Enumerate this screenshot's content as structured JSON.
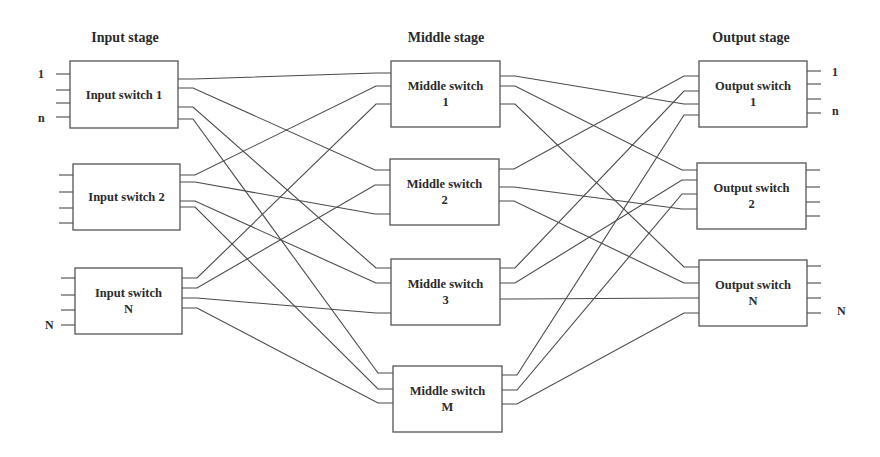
{
  "diagram": {
    "type": "three-stage Clos switching network",
    "stages": [
      {
        "id": "input",
        "title": "Input stage",
        "title_x": 125,
        "title_y": 42
      },
      {
        "id": "middle",
        "title": "Middle stage",
        "title_x": 446,
        "title_y": 42
      },
      {
        "id": "output",
        "title": "Output stage",
        "title_x": 751,
        "title_y": 42
      }
    ],
    "colors": {
      "line": "#4a4a4a",
      "box_border": "#555555",
      "text": "#2a2a2a",
      "background": "#ffffff"
    },
    "nodes": [
      {
        "id": "in1",
        "stage": "input",
        "label_lines": [
          "Input switch 1"
        ],
        "x": 70,
        "y": 61,
        "w": 108,
        "h": 67,
        "left_ports": [
          74,
          90,
          103,
          117
        ],
        "right_ports": [
          79,
          88,
          107,
          119
        ]
      },
      {
        "id": "in2",
        "stage": "input",
        "label_lines": [
          "Input switch 2"
        ],
        "x": 73,
        "y": 164,
        "w": 107,
        "h": 66,
        "left_ports": [
          175,
          192,
          208,
          223
        ],
        "right_ports": [
          175,
          182,
          201,
          207
        ]
      },
      {
        "id": "inN",
        "stage": "input",
        "label_lines": [
          "Input switch",
          "N"
        ],
        "x": 75,
        "y": 268,
        "w": 107,
        "h": 66,
        "left_ports": [
          278,
          295,
          310,
          325
        ],
        "right_ports": [
          278,
          288,
          298,
          308
        ]
      },
      {
        "id": "mid1",
        "stage": "middle",
        "label_lines": [
          "Middle switch",
          "1"
        ],
        "x": 391,
        "y": 61,
        "w": 109,
        "h": 66,
        "left_ports": [
          73,
          86,
          104
        ],
        "right_ports": [
          76,
          86,
          104
        ]
      },
      {
        "id": "mid2",
        "stage": "middle",
        "label_lines": [
          "Middle switch",
          "2"
        ],
        "x": 390,
        "y": 159,
        "w": 109,
        "h": 66,
        "left_ports": [
          170,
          185,
          214
        ],
        "right_ports": [
          169,
          187,
          201
        ]
      },
      {
        "id": "mid3",
        "stage": "middle",
        "label_lines": [
          "Middle switch",
          "3"
        ],
        "x": 391,
        "y": 259,
        "w": 109,
        "h": 66,
        "left_ports": [
          268,
          283,
          313
        ],
        "right_ports": [
          268,
          283,
          299
        ]
      },
      {
        "id": "midM",
        "stage": "middle",
        "label_lines": [
          "Middle switch",
          "M"
        ],
        "x": 393,
        "y": 366,
        "w": 109,
        "h": 66,
        "left_ports": [
          373,
          389,
          403
        ],
        "right_ports": [
          375,
          390,
          404
        ]
      },
      {
        "id": "out1",
        "stage": "output",
        "label_lines": [
          "Output switch",
          "1"
        ],
        "x": 699,
        "y": 61,
        "w": 108,
        "h": 66,
        "left_ports": [
          76,
          91,
          104,
          115
        ],
        "right_ports": [
          71,
          84,
          99,
          113
        ]
      },
      {
        "id": "out2",
        "stage": "output",
        "label_lines": [
          "Output switch",
          "2"
        ],
        "x": 697,
        "y": 163,
        "w": 109,
        "h": 66,
        "left_ports": [
          170,
          180,
          194,
          209
        ],
        "right_ports": [
          170,
          187,
          202,
          216
        ]
      },
      {
        "id": "outN",
        "stage": "output",
        "label_lines": [
          "Output switch",
          "N"
        ],
        "x": 699,
        "y": 260,
        "w": 108,
        "h": 66,
        "left_ports": [
          267,
          283,
          298,
          313
        ],
        "right_ports": [
          266,
          283,
          298,
          313
        ]
      }
    ],
    "port_labels": [
      {
        "text": "1",
        "x": 38,
        "y": 78
      },
      {
        "text": "n",
        "x": 38,
        "y": 122
      },
      {
        "text": "N",
        "x": 45,
        "y": 329
      },
      {
        "text": "1",
        "x": 832,
        "y": 76
      },
      {
        "text": "n",
        "x": 832,
        "y": 115
      },
      {
        "text": "N",
        "x": 837,
        "y": 315
      }
    ],
    "edges": [
      {
        "from": "in1",
        "fp": 0,
        "to": "mid1",
        "tp": 0
      },
      {
        "from": "in1",
        "fp": 1,
        "to": "mid2",
        "tp": 0
      },
      {
        "from": "in1",
        "fp": 2,
        "to": "mid3",
        "tp": 0
      },
      {
        "from": "in1",
        "fp": 3,
        "to": "midM",
        "tp": 0
      },
      {
        "from": "in2",
        "fp": 0,
        "to": "mid1",
        "tp": 1
      },
      {
        "from": "in2",
        "fp": 1,
        "to": "mid2",
        "tp": 2
      },
      {
        "from": "in2",
        "fp": 2,
        "to": "mid3",
        "tp": 1
      },
      {
        "from": "in2",
        "fp": 3,
        "to": "midM",
        "tp": 1
      },
      {
        "from": "inN",
        "fp": 0,
        "to": "mid1",
        "tp": 2
      },
      {
        "from": "inN",
        "fp": 1,
        "to": "mid2",
        "tp": 1
      },
      {
        "from": "inN",
        "fp": 2,
        "to": "mid3",
        "tp": 2
      },
      {
        "from": "inN",
        "fp": 3,
        "to": "midM",
        "tp": 2
      },
      {
        "from": "mid1",
        "fp": 0,
        "to": "out1",
        "tp": 2
      },
      {
        "from": "mid1",
        "fp": 1,
        "to": "out2",
        "tp": 0
      },
      {
        "from": "mid1",
        "fp": 2,
        "to": "outN",
        "tp": 0
      },
      {
        "from": "mid2",
        "fp": 0,
        "to": "out1",
        "tp": 0
      },
      {
        "from": "mid2",
        "fp": 1,
        "to": "out2",
        "tp": 3
      },
      {
        "from": "mid2",
        "fp": 2,
        "to": "outN",
        "tp": 1
      },
      {
        "from": "mid3",
        "fp": 0,
        "to": "out1",
        "tp": 1
      },
      {
        "from": "mid3",
        "fp": 1,
        "to": "out2",
        "tp": 1
      },
      {
        "from": "mid3",
        "fp": 2,
        "to": "outN",
        "tp": 2
      },
      {
        "from": "midM",
        "fp": 0,
        "to": "out1",
        "tp": 3
      },
      {
        "from": "midM",
        "fp": 1,
        "to": "out2",
        "tp": 2
      },
      {
        "from": "midM",
        "fp": 2,
        "to": "outN",
        "tp": 3
      }
    ]
  }
}
